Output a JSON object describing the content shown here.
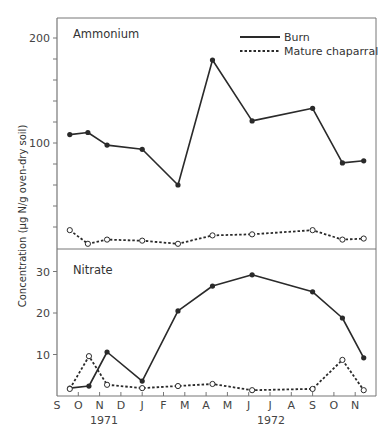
{
  "chart_data": [
    {
      "type": "line",
      "title": "Ammonium",
      "ylabel": "Concentration (µg N/g oven-dry soil)",
      "xlabel": "",
      "ylim": [
        0,
        200
      ],
      "yticks_labeled": [
        100,
        200
      ],
      "yticks_minor_step": 20,
      "x_months_since_sep_1971": [
        0.6,
        1.45,
        2.35,
        4.0,
        5.68,
        7.3,
        9.16,
        12.0,
        13.4,
        14.4
      ],
      "series": [
        {
          "name": "Burn",
          "style": "solid",
          "marker": "filled-circle",
          "values": [
            108,
            110,
            98,
            94,
            60,
            179,
            121,
            133,
            81,
            83
          ]
        },
        {
          "name": "Mature chaparral",
          "style": "dotted",
          "marker": "open-circle",
          "values": [
            17,
            4,
            8,
            7,
            4,
            12,
            13,
            17,
            8,
            9
          ]
        }
      ],
      "legend_position": "upper-right",
      "grid": false
    },
    {
      "type": "line",
      "title": "Nitrate",
      "ylabel": "Concentration (µg N/g oven-dry soil)",
      "xlabel": "",
      "ylim": [
        0,
        35
      ],
      "yticks_labeled": [
        10,
        20,
        30
      ],
      "x_months_since_sep_1971": [
        0.6,
        1.5,
        2.35,
        4.0,
        5.68,
        7.3,
        9.16,
        12.0,
        13.4,
        14.4
      ],
      "series": [
        {
          "name": "Burn",
          "style": "solid",
          "marker": "filled-circle",
          "values": [
            1.9,
            2.4,
            10.6,
            3.6,
            20.5,
            26.5,
            29.2,
            25.1,
            18.8,
            9.2
          ]
        },
        {
          "name": "Mature chaparral",
          "style": "dotted",
          "marker": "open-circle",
          "values": [
            1.7,
            9.6,
            2.7,
            1.9,
            2.4,
            2.9,
            1.4,
            1.7,
            8.7,
            1.4
          ]
        }
      ],
      "grid": false
    }
  ],
  "labels": {
    "ylabel": "Concentration (µg N/g oven-dry soil)",
    "panel_top_title": "Ammonium",
    "panel_bottom_title": "Nitrate",
    "legend_burn": "Burn",
    "legend_mature": "Mature chaparral",
    "year_1971": "1971",
    "year_1972": "1972",
    "months": [
      "S",
      "O",
      "N",
      "D",
      "J",
      "F",
      "M",
      "A",
      "M",
      "J",
      "J",
      "A",
      "S",
      "O",
      "N"
    ],
    "top_tick_labels": [
      "100",
      "200"
    ],
    "bottom_tick_labels": [
      "10",
      "20",
      "30"
    ]
  },
  "colors": {
    "line": "#2a2a2a",
    "axis": "#666666",
    "text": "#444444"
  }
}
